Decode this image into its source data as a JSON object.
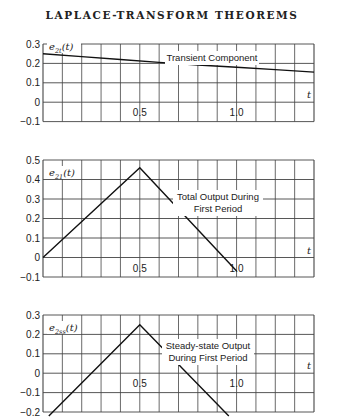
{
  "header": {
    "title": "LAPLACE-TRANSFORM THEOREMS"
  },
  "chart_data": [
    {
      "type": "line",
      "title": "Transient Component",
      "ylabel": "e2t(t)",
      "xlabel": "t",
      "xlim": [
        0,
        1.4
      ],
      "ylim": [
        -0.1,
        0.3
      ],
      "yticks": [
        "0.3",
        "0.2",
        "0.1",
        "0",
        "-0.1"
      ],
      "xticks": [
        "0.5",
        "1.0"
      ],
      "grid": true,
      "series": [
        {
          "name": "Transient Component",
          "x": [
            0,
            0.2,
            0.4,
            0.6,
            0.8,
            1.0,
            1.2,
            1.4
          ],
          "y": [
            0.25,
            0.235,
            0.22,
            0.205,
            0.192,
            0.18,
            0.168,
            0.155
          ]
        }
      ]
    },
    {
      "type": "line",
      "title": "Total Output During First Period",
      "ylabel": "e21(t)",
      "xlabel": "t",
      "xlim": [
        0,
        1.4
      ],
      "ylim": [
        -0.1,
        0.5
      ],
      "yticks": [
        "0.5",
        "0.4",
        "0.3",
        "0.2",
        "0.1",
        "0",
        "-0.1"
      ],
      "xticks": [
        "0.5",
        "1.0"
      ],
      "grid": true,
      "series": [
        {
          "name": "Total Output During First Period",
          "x": [
            0,
            0.5,
            1.0
          ],
          "y": [
            0,
            0.46,
            -0.07
          ]
        }
      ]
    },
    {
      "type": "line",
      "title": "Steady-state Output During First Period",
      "ylabel": "e2ss(t)",
      "xlabel": "t",
      "xlim": [
        0,
        1.4
      ],
      "ylim": [
        -0.2,
        0.3
      ],
      "yticks": [
        "0.3",
        "0.2",
        "0.1",
        "0",
        "-0.1",
        "-0.2"
      ],
      "xticks": [
        "0.5",
        "1.0"
      ],
      "grid": true,
      "series": [
        {
          "name": "Steady-state Output During First Period",
          "x": [
            0.03,
            0.5,
            0.96
          ],
          "y": [
            -0.22,
            0.25,
            -0.22
          ]
        }
      ]
    }
  ],
  "labels": {
    "c1": {
      "ylab": "e",
      "sub": "2t",
      "arg": "(t)",
      "ann": "Transient Component",
      "t": "t"
    },
    "c2": {
      "ylab": "e",
      "sub": "21",
      "arg": "(t)",
      "ann1": "Total Output During",
      "ann2": "First Period",
      "t": "t"
    },
    "c3": {
      "ylab": "e",
      "sub": "2ss",
      "arg": "(t)",
      "ann1": "Steady-state Output",
      "ann2": "During First Period",
      "t": "t"
    }
  }
}
